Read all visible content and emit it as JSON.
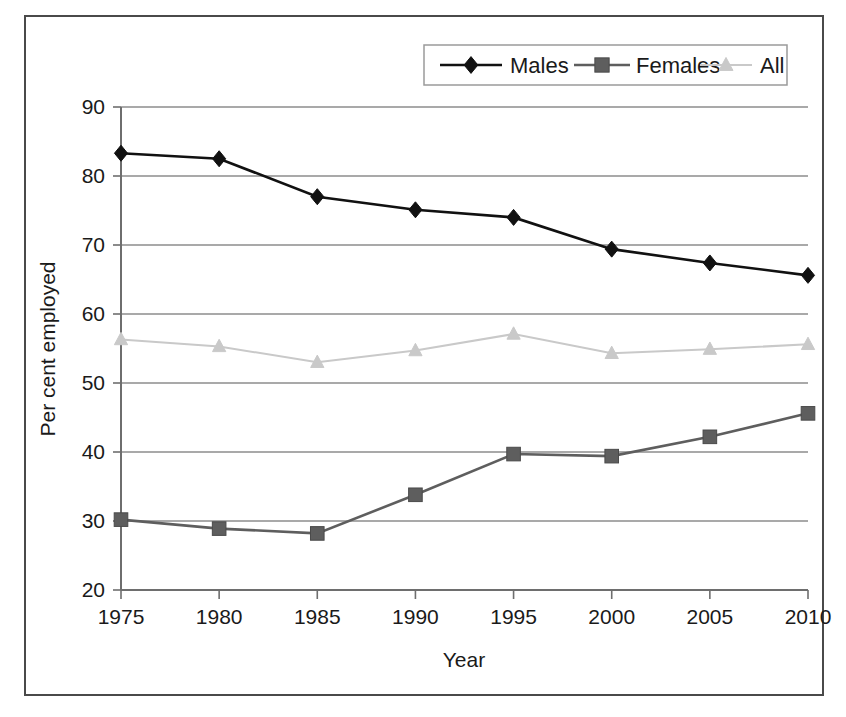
{
  "chart_data": {
    "type": "line",
    "title": "",
    "xlabel": "Year",
    "ylabel": "Per cent employed",
    "categories": [
      1975,
      1980,
      1985,
      1990,
      1995,
      2000,
      2005,
      2010
    ],
    "x_tick_labels": [
      "1975",
      "1980",
      "1985",
      "1990",
      "1995",
      "2000",
      "2005",
      "2010"
    ],
    "y_tick_labels": [
      "20",
      "30",
      "40",
      "50",
      "60",
      "70",
      "80",
      "90"
    ],
    "y_ticks": [
      20,
      30,
      40,
      50,
      60,
      70,
      80,
      90
    ],
    "ylim": [
      20,
      90
    ],
    "xlim": [
      1975,
      2010
    ],
    "grid": "horizontal",
    "legend_position": "top-right",
    "series": [
      {
        "name": "Males",
        "marker": "diamond",
        "color": "#111111",
        "values": [
          83.3,
          82.5,
          77.0,
          75.1,
          74.0,
          69.4,
          67.4,
          65.6
        ]
      },
      {
        "name": "Females",
        "marker": "square",
        "color": "#5e5e5e",
        "values": [
          30.2,
          28.9,
          28.2,
          33.8,
          39.7,
          39.4,
          42.2,
          45.6
        ]
      },
      {
        "name": "All",
        "marker": "triangle",
        "color": "#c9c9c9",
        "values": [
          56.3,
          55.3,
          53.0,
          54.7,
          57.1,
          54.3,
          54.9,
          55.6
        ]
      }
    ]
  },
  "legend": {
    "entries": [
      {
        "label": "Males"
      },
      {
        "label": "Females"
      },
      {
        "label": "All"
      }
    ]
  },
  "axes": {
    "x_title": "Year",
    "y_title": "Per cent employed"
  },
  "colors": {
    "males": "#111111",
    "females": "#5e5e5e",
    "all": "#c9c9c9",
    "gridline": "#8c8c8c",
    "axis": "#6e6e6e",
    "frame": "#4a4a4a"
  }
}
